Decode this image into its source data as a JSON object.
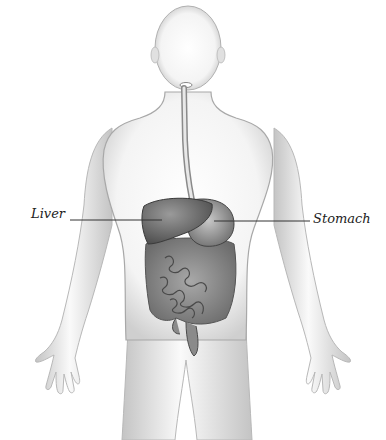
{
  "diagram": {
    "labels": [
      {
        "id": "liver",
        "text": "Liver"
      },
      {
        "id": "stomach",
        "text": "Stomach"
      }
    ],
    "colors": {
      "body_outline": "#9a9a9a",
      "body_shade": "#d6d6d6",
      "organ_dark": "#6e6e6e",
      "organ_mid": "#8c8c8c",
      "leader_line": "#333333"
    }
  }
}
